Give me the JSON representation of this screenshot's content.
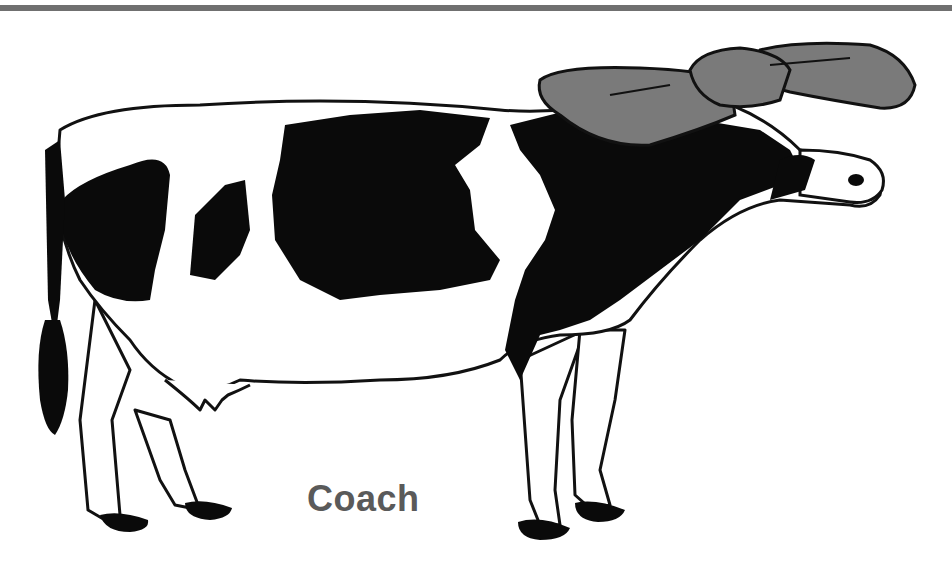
{
  "image": {
    "caption": "Coach",
    "subject": "cow-wearing-hat",
    "colors": {
      "rule": "#707070",
      "outline": "#111111",
      "spots": "#0a0a0a",
      "hat": "#7a7a7a",
      "caption": "#5a5a5a",
      "background": "#ffffff"
    }
  }
}
